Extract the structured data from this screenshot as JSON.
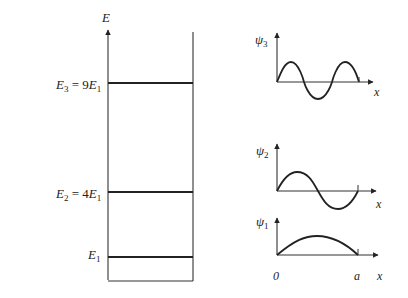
{
  "colors": {
    "ink": "#222222",
    "background": "#ffffff"
  },
  "energy_diagram": {
    "axis_label": "E",
    "levels": [
      {
        "name": "E3",
        "label_main": "E",
        "label_sub": "3",
        "label_rest": " = 9",
        "label_main2": "E",
        "label_sub2": "1",
        "multiple": 9
      },
      {
        "name": "E2",
        "label_main": "E",
        "label_sub": "2",
        "label_rest": " = 4",
        "label_main2": "E",
        "label_sub2": "1",
        "multiple": 4
      },
      {
        "name": "E1",
        "label_main": "E",
        "label_sub": "1",
        "multiple": 1
      }
    ]
  },
  "wavefunctions": [
    {
      "name": "psi3",
      "symbol": "ψ",
      "sub": "3",
      "x_label": "x",
      "half_wavelengths": 3
    },
    {
      "name": "psi2",
      "symbol": "ψ",
      "sub": "2",
      "x_label": "x",
      "half_wavelengths": 2
    },
    {
      "name": "psi1",
      "symbol": "ψ",
      "sub": "1",
      "x_label": "x",
      "half_wavelengths": 1,
      "origin_label": "0",
      "end_label": "a"
    }
  ]
}
